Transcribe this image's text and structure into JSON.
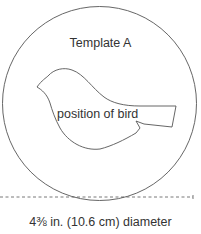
{
  "template": {
    "title": "Template A",
    "shape_label": "position of bird",
    "dimension_label": "4⅜ in. (10.6 cm) diameter"
  },
  "colors": {
    "stroke": "#555555",
    "text": "#333333",
    "background": "#ffffff"
  }
}
